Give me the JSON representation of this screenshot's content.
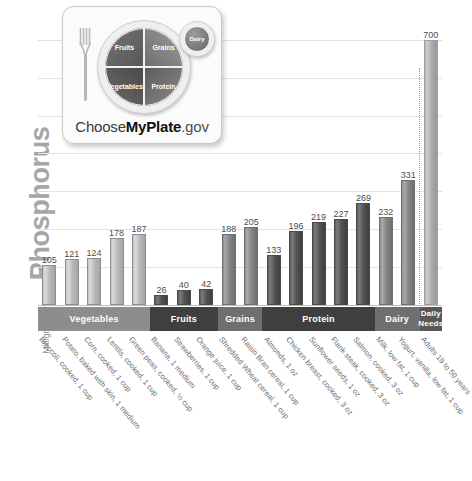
{
  "yaxis": {
    "small_label": "Milligrams (mg) of",
    "big_label": "Phosphorus"
  },
  "logo": {
    "name": "myplate-logo",
    "fruits": "Fruits",
    "grains": "Grains",
    "vegetables": "Vegetables",
    "protein": "Protein",
    "dairy": "Dairy",
    "wordmark_prefix": "Choose",
    "wordmark_bold": "MyPlate",
    "wordmark_suffix": ".gov"
  },
  "groups": [
    {
      "label": "Vegetables",
      "style": "seg-light",
      "start": 0,
      "count": 5
    },
    {
      "label": "Fruits",
      "style": "seg-dark",
      "start": 5,
      "count": 3
    },
    {
      "label": "Grains",
      "style": "seg-mid",
      "start": 8,
      "count": 2
    },
    {
      "label": "Protein",
      "style": "seg-dark",
      "start": 10,
      "count": 5
    },
    {
      "label": "Dairy",
      "style": "seg-mid",
      "start": 15,
      "count": 2
    },
    {
      "label": "Daily Needs",
      "style": "seg-needs",
      "start": 17,
      "count": 1
    }
  ],
  "chart_data": {
    "type": "bar",
    "title": "",
    "xlabel": "",
    "ylabel": "Milligrams (mg) of Phosphorus",
    "ylim": [
      0,
      760
    ],
    "grid": true,
    "gridlines": [
      100,
      200,
      300,
      400,
      500,
      600,
      700
    ],
    "legend": "none",
    "categories": [
      "Broccoli, cooked, 1 cup",
      "Potato, baked with skin, 1 medium",
      "Corn, cooked, 1 cup",
      "Lentils, cooked, 1 cup",
      "Green peas, cooked, ½ cup",
      "Banana, 1 medium",
      "Strawberries, 1 cup",
      "Orange juice, 1 cup",
      "Shredded Wheat cereal, 1 cup",
      "Raisin Bran cereal, 1 cup",
      "Almonds, 1 oz",
      "Chicken breast, cooked, 3 oz",
      "Sunflower seeds, 1 oz",
      "Flank steak, cooked, 3 oz",
      "Salmon, cooked, 3 oz",
      "Milk, low fat, 1 cup",
      "Yogurt, vanilla, low fat, 1 cup",
      "Adults 19 to 50 years"
    ],
    "values": [
      105,
      121,
      124,
      178,
      187,
      26,
      40,
      42,
      188,
      205,
      133,
      196,
      219,
      227,
      269,
      232,
      331,
      700
    ],
    "group_of": [
      "Vegetables",
      "Vegetables",
      "Vegetables",
      "Vegetables",
      "Vegetables",
      "Fruits",
      "Fruits",
      "Fruits",
      "Grains",
      "Grains",
      "Protein",
      "Protein",
      "Protein",
      "Protein",
      "Protein",
      "Dairy",
      "Dairy",
      "Daily Needs"
    ],
    "bar_styles": [
      "light",
      "light",
      "light",
      "light",
      "light",
      "dark",
      "dark",
      "dark",
      "mid",
      "mid",
      "dark",
      "dark",
      "dark",
      "dark",
      "dark",
      "mid",
      "mid",
      "needs"
    ]
  },
  "colors": {
    "bar_light": "#b9b9b9",
    "bar_mid": "#858585",
    "bar_dark": "#525252",
    "bar_needs": "#ababab",
    "band_light": "#8d8d8d",
    "band_dark": "#3f3f3f",
    "band_mid": "#6f6f6f",
    "grid": "#e2e2e2",
    "axis_text": "#6b6b6b"
  }
}
